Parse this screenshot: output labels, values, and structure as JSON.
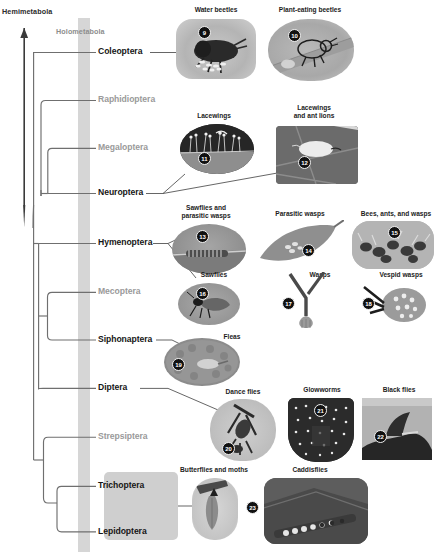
{
  "figure": {
    "type": "phylogenetic-tree",
    "axis_label": "Hemimetabola",
    "band_label": "Holometabola"
  },
  "taxa": [
    {
      "id": "coleoptera",
      "label": "Coleoptera",
      "style": "bold",
      "y": 52
    },
    {
      "id": "raphidioptera",
      "label": "Raphidioptera",
      "style": "grey",
      "y": 100
    },
    {
      "id": "megaloptera",
      "label": "Megaloptera",
      "style": "grey",
      "y": 148
    },
    {
      "id": "neuroptera",
      "label": "Neuroptera",
      "style": "bold",
      "y": 193
    },
    {
      "id": "hymenoptera",
      "label": "Hymenoptera",
      "style": "bold",
      "y": 243
    },
    {
      "id": "mecoptera",
      "label": "Mecoptera",
      "style": "grey",
      "y": 292
    },
    {
      "id": "siphonaptera",
      "label": "Siphonaptera",
      "style": "bold",
      "y": 340
    },
    {
      "id": "diptera",
      "label": "Diptera",
      "style": "bold",
      "y": 388
    },
    {
      "id": "strepsiptera",
      "label": "Strepsiptera",
      "style": "grey",
      "y": 437
    },
    {
      "id": "trichoptera",
      "label": "Trichoptera",
      "style": "bold",
      "y": 486
    },
    {
      "id": "lepidoptera",
      "label": "Lepidoptera",
      "style": "bold",
      "y": 532
    }
  ],
  "photos": [
    {
      "id": "water-beetles",
      "caption": "Water beetles",
      "number": "9"
    },
    {
      "id": "plant-eating-beetles",
      "caption": "Plant-eating beetles",
      "number": "10"
    },
    {
      "id": "lacewings",
      "caption": "Lacewings",
      "number": "11"
    },
    {
      "id": "lacewings-and-ant-lions",
      "caption": "Lacewings\nand ant lions",
      "number": "12"
    },
    {
      "id": "sawflies-parasitic-wasps",
      "caption": "Sawflies and\nparasitic wasps",
      "number": "13"
    },
    {
      "id": "parasitic-wasps",
      "caption": "Parasitic wasps",
      "number": "14"
    },
    {
      "id": "bees-ants-and-wasps",
      "caption": "Bees, ants, and wasps",
      "number": "15"
    },
    {
      "id": "sawflies",
      "caption": "Sawflies",
      "number": "16"
    },
    {
      "id": "wasps",
      "caption": "Wasps",
      "number": "17"
    },
    {
      "id": "vespid-wasps",
      "caption": "Vespid wasps",
      "number": "18"
    },
    {
      "id": "fleas",
      "caption": "Fleas",
      "number": "19"
    },
    {
      "id": "dance-flies",
      "caption": "Dance flies",
      "number": "20"
    },
    {
      "id": "glowworms",
      "caption": "Glowworms",
      "number": "21"
    },
    {
      "id": "black-flies",
      "caption": "Black flies",
      "number": "22"
    },
    {
      "id": "butterflies-and-moths",
      "caption": "Butterflies and moths",
      "number": ""
    },
    {
      "id": "caddisflies",
      "caption": "Caddisflies",
      "number": "23"
    }
  ],
  "colors": {
    "band": "#d6d6d6",
    "branch": "#6f6f6f",
    "axis": "#3a3a3a",
    "bold_text": "#161616",
    "grey_text": "#9a9a9a",
    "highlight_box": "#cfcfcf"
  }
}
